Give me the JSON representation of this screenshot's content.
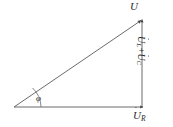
{
  "figure": {
    "kind": "phasor-diagram",
    "background_color": "#ffffff",
    "line_color": "#555555",
    "text_color": "#2b2b2b",
    "width": 173,
    "height": 127
  },
  "labels": {
    "resultant": {
      "symbol": "U",
      "subscript": "",
      "has_dot": true,
      "text": "U̇"
    },
    "resistive": {
      "symbol": "U",
      "subscript": "R",
      "has_dot": true,
      "text": "U̇R"
    },
    "reactive": {
      "symbol_left": "U",
      "subscript_left": "L",
      "operator": "+",
      "symbol_right": "U",
      "subscript_right": "C",
      "has_dot": true,
      "text": "U̇L + U̇C"
    },
    "angle": {
      "symbol": "φ",
      "text": "φ"
    }
  },
  "vectors": [
    {
      "name": "resultant-voltage",
      "label": "U̇",
      "from": [
        14,
        107
      ],
      "to": [
        142,
        20
      ],
      "arrowhead": true
    },
    {
      "name": "resistor-voltage",
      "label": "U̇R",
      "from": [
        14,
        107
      ],
      "to": [
        143,
        107
      ],
      "arrowhead": true
    },
    {
      "name": "reactance-voltage",
      "label": "U̇L + U̇C",
      "from": [
        142,
        107
      ],
      "to": [
        142,
        19
      ],
      "arrowhead": true
    }
  ],
  "angle_arc": {
    "name": "phase-angle-arc",
    "vertex": [
      14,
      107
    ],
    "radius": 27,
    "label": "φ"
  }
}
